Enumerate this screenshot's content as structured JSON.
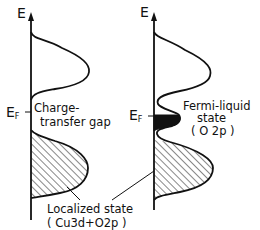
{
  "diagram": {
    "left_panel": {
      "axis_label": "E",
      "fermi_label": "E",
      "fermi_subscript": "F",
      "gap_label_line1": "Charge-",
      "gap_label_line2": "transfer gap"
    },
    "right_panel": {
      "axis_label": "E",
      "fermi_label": "E",
      "fermi_subscript": "F",
      "state_label_line1": "Fermi-liquid",
      "state_label_line2": "state",
      "state_label_line3": "( O 2p )"
    },
    "shared": {
      "localized_line1": "Localized state",
      "localized_line2": "( Cu3d+O2p )"
    },
    "colors": {
      "ink": "#111111",
      "background": "#ffffff"
    }
  }
}
